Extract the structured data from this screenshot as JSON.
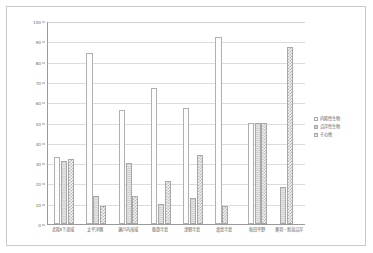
{
  "chart_data": {
    "type": "bar",
    "title": "",
    "xlabel": "",
    "ylabel": "",
    "ylim": [
      0,
      100
    ],
    "yticks": [
      0,
      10,
      20,
      30,
      40,
      50,
      60,
      70,
      80,
      90,
      100
    ],
    "grid": true,
    "legend_position": "right",
    "categories": [
      "北陸Ⅱ下流域",
      "太平洋側",
      "瀬戸内海域",
      "能登半島",
      "津軽半島",
      "渡島半島",
      "秋田平野",
      "奥羽・新潟沿岸"
    ],
    "series": [
      {
        "name": "内陸性生物",
        "values": [
          33,
          84,
          56,
          67,
          57,
          92,
          50,
          0
        ]
      },
      {
        "name": "沿岸性生物",
        "values": [
          31,
          14,
          30,
          10,
          13,
          0,
          50,
          18
        ]
      },
      {
        "name": "その他",
        "values": [
          32,
          9,
          14,
          21,
          34,
          9,
          50,
          87
        ]
      }
    ]
  },
  "axis": {
    "y_tick_labels": [
      "0",
      "10",
      "20",
      "30",
      "40",
      "50",
      "60",
      "70",
      "80",
      "90",
      "100"
    ]
  },
  "legend": {
    "items": [
      {
        "label": "内陸性生物",
        "swatch": "dotted-white"
      },
      {
        "label": "沿岸性生物",
        "swatch": "solid-gray"
      },
      {
        "label": "その他",
        "swatch": "checkered"
      }
    ]
  }
}
